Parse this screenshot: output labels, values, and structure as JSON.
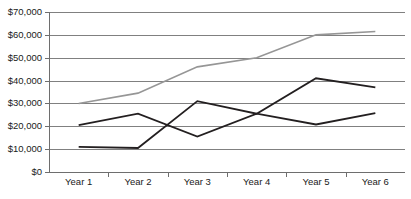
{
  "chart_data": {
    "type": "line",
    "title": "",
    "xlabel": "",
    "ylabel": "",
    "categories": [
      "Year 1",
      "Year 2",
      "Year 3",
      "Year 4",
      "Year 5",
      "Year 6"
    ],
    "ylim": [
      0,
      70000
    ],
    "ytick_values": [
      0,
      10000,
      20000,
      30000,
      40000,
      50000,
      60000,
      70000
    ],
    "ytick_labels": [
      "$0",
      "$10,000",
      "$20,000",
      "$30,000",
      "$40,000",
      "$50,000",
      "$60,000",
      "$70,000"
    ],
    "grid": true,
    "legend": "none",
    "series": [
      {
        "name": "series-gray",
        "color": "#969696",
        "width": 1.6,
        "values": [
          30000,
          34500,
          46000,
          50000,
          60000,
          61500
        ]
      },
      {
        "name": "series-black-a",
        "color": "#231f20",
        "width": 1.8,
        "values": [
          20500,
          25500,
          15500,
          25500,
          20800,
          25800
        ]
      },
      {
        "name": "series-black-b",
        "color": "#231f20",
        "width": 1.8,
        "values": [
          11000,
          10500,
          31000,
          25500,
          41000,
          37000
        ]
      }
    ]
  },
  "layout": {
    "plot_left": 49,
    "plot_right": 405,
    "plot_top": 12,
    "plot_bottom": 172,
    "label_gap": 5,
    "xlabel_y": 178
  }
}
